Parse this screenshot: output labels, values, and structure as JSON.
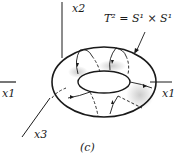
{
  "figure": {
    "panel_label": "(c)",
    "equation": "T² = S¹ × S¹",
    "axes": {
      "x1_left": "x1",
      "x1_right": "x1",
      "x2": "x2",
      "x3": "x3"
    },
    "colors": {
      "ink": "#1a1a1a",
      "background": "#ffffff"
    }
  }
}
